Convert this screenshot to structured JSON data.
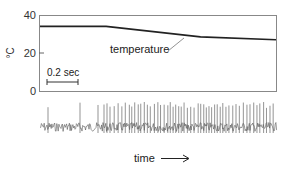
{
  "chart_data": [
    {
      "type": "line",
      "title": "",
      "xlabel": "",
      "ylabel": "°C",
      "ylim": [
        0,
        40
      ],
      "yticks": [
        0,
        20,
        40
      ],
      "grid": false,
      "annotation": "temperature",
      "scale_bar": {
        "label": "0.2 sec",
        "seconds": 0.2
      },
      "series": [
        {
          "name": "temperature",
          "x_fraction": [
            0.0,
            0.28,
            0.68,
            1.0
          ],
          "values": [
            34,
            34,
            28.5,
            27
          ]
        }
      ]
    },
    {
      "type": "line",
      "title": "",
      "description": "neural spike trace; firing rate increases as temperature drops",
      "xlabel": "time",
      "ylabel": "",
      "axis_arrow": "right"
    }
  ],
  "labels": {
    "y_unit": "°C",
    "y_ticks": [
      "40",
      "20",
      "0"
    ],
    "temperature": "temperature",
    "scale_bar": "0.2 sec",
    "time": "time"
  }
}
